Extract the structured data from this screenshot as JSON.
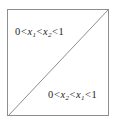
{
  "figure": {
    "name": "unit-square-ordered-region-diagram",
    "background_color": "#ffffff",
    "border_color": "#8e8e8e",
    "line_color": "#8e8e8e",
    "text_color": "#231f20"
  },
  "square": {
    "label": "unit square region"
  },
  "diagonal": {
    "label": "diagonal x1 = x2"
  },
  "labels": {
    "upper": {
      "full_text": "0 < x1 < x2 < 1",
      "zero": "0",
      "rel1": "<",
      "var1": "x",
      "sub1": "1",
      "rel2": "<",
      "var2": "x",
      "sub2": "2",
      "rel3": "<",
      "one": "1"
    },
    "lower": {
      "full_text": "0 < x2 < x1 < 1",
      "zero": "0",
      "rel1": "<",
      "var1": "x",
      "sub1": "2",
      "rel2": "<",
      "var2": "x",
      "sub2": "1",
      "rel3": "<",
      "one": "1"
    }
  }
}
